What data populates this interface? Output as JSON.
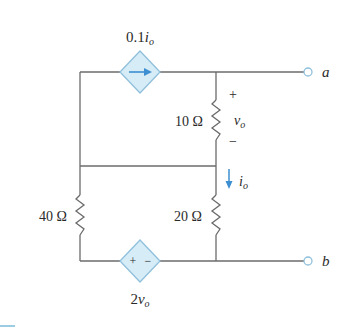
{
  "diagram": {
    "type": "circuit",
    "colors": {
      "wire": "#6b6b6b",
      "source_fill": "#d6ecf7",
      "source_stroke": "#8fc0dc",
      "arrow": "#3d8fd1",
      "terminal": "#8fc0dc",
      "text": "#2a2a2a"
    },
    "components": {
      "dep_current_source": {
        "label_coef": "0.1",
        "label_var": "i",
        "label_sub": "o"
      },
      "r10": {
        "label": "10 Ω"
      },
      "r20": {
        "label": "20 Ω"
      },
      "r40": {
        "label": "40 Ω"
      },
      "dep_voltage_source": {
        "label_coef": "2",
        "label_var": "v",
        "label_sub": "o",
        "plus": "+",
        "minus": "−"
      },
      "vo": {
        "plus": "+",
        "var": "v",
        "sub": "o",
        "minus": "−"
      },
      "io": {
        "var": "i",
        "sub": "o"
      }
    },
    "terminals": {
      "a": "a",
      "b": "b"
    }
  }
}
